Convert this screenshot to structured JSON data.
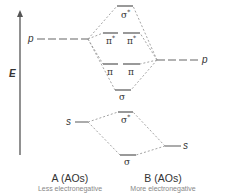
{
  "diagram": {
    "type": "molecular-orbital-energy-diagram",
    "axis": {
      "label": "E",
      "direction": "up"
    },
    "left_atom": {
      "title": "A (AOs)",
      "subtitle": "Less electronegative",
      "orbitals": {
        "p": "p",
        "s": "s"
      }
    },
    "right_atom": {
      "title": "B (AOs)",
      "subtitle": "More electronegative",
      "orbitals": {
        "p": "p",
        "s": "s"
      }
    },
    "molecular_orbitals": {
      "p_sigma_star": {
        "symbol": "σ",
        "star": "*"
      },
      "p_pi_star_1": {
        "symbol": "π",
        "star": "*"
      },
      "p_pi_star_2": {
        "symbol": "π",
        "star": "*"
      },
      "p_pi_1": {
        "symbol": "π"
      },
      "p_pi_2": {
        "symbol": "π"
      },
      "p_sigma": {
        "symbol": "σ"
      },
      "s_sigma_star": {
        "symbol": "σ",
        "star": "*"
      },
      "s_sigma": {
        "symbol": "σ"
      }
    },
    "colors": {
      "levels": "#555555",
      "correlation_lines": "#9a9a9a",
      "text": "#333333",
      "subtitle": "#888888"
    }
  }
}
